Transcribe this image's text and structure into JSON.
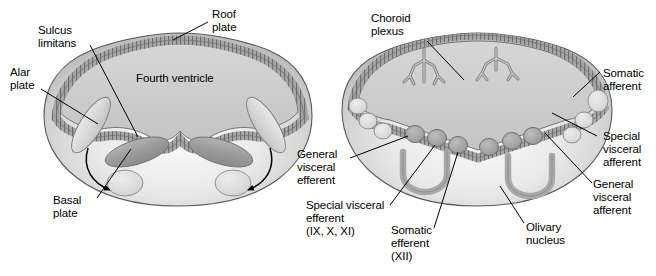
{
  "figure": {
    "panels": [
      {
        "id": "left-panel",
        "name": "early-medulla-cross-section"
      },
      {
        "id": "right-panel",
        "name": "later-medulla-cross-section"
      }
    ]
  },
  "colors": {
    "outline": "#4d4d4d",
    "body_light": "#f2f2f2",
    "body_mid": "#c8c8c8",
    "body_dark": "#9a9a9a",
    "ventricle": "#cfcfcf",
    "roof_plate": "#9e9e9e",
    "nucleus_dark": "#a8a8a8",
    "nucleus_light": "#dcdcdc",
    "label_text": "#000000",
    "leader_line": "#000000"
  },
  "left_panel": {
    "labels": [
      {
        "name": "sulcus-limitans",
        "text": "Sulcus\nlimitans"
      },
      {
        "name": "roof-plate",
        "text": "Roof\nplate"
      },
      {
        "name": "alar-plate",
        "text": "Alar\nplate"
      },
      {
        "name": "fourth-ventricle",
        "text": "Fourth ventricle"
      },
      {
        "name": "basal-plate",
        "text": "Basal\nplate"
      }
    ]
  },
  "right_panel": {
    "labels": [
      {
        "name": "choroid-plexus",
        "text": "Choroid\nplexus"
      },
      {
        "name": "somatic-afferent",
        "text": "Somatic\nafferent"
      },
      {
        "name": "special-visceral-afferent",
        "text": "Special\nvisceral\nafferent"
      },
      {
        "name": "general-visceral-afferent",
        "text": "General\nvisceral\nafferent"
      },
      {
        "name": "general-visceral-efferent",
        "text": "General\nvisceral\nefferent"
      },
      {
        "name": "special-visceral-efferent",
        "text": "Special visceral\nefferent\n(IX, X, XI)"
      },
      {
        "name": "somatic-efferent",
        "text": "Somatic\nefferent\n(XII)"
      },
      {
        "name": "olivary-nucleus",
        "text": "Olivary\nnucleus"
      }
    ]
  }
}
